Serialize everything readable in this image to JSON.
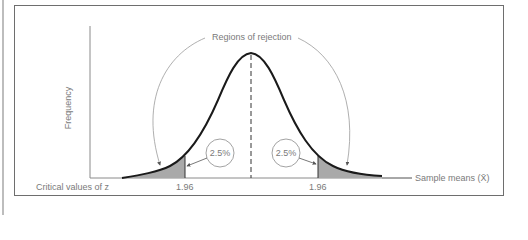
{
  "diagram": {
    "title_annotation": "Regions of rejection",
    "y_axis_label": "Frequency",
    "x_axis_label": "Sample means (X̄)",
    "critical_label": "Critical values of z",
    "left_critical_value": "1.96",
    "right_critical_value": "1.96",
    "left_tail_percent": "2.5%",
    "right_tail_percent": "2.5%",
    "colors": {
      "frame": "#6e6e6e",
      "curve": "#1a1a1a",
      "shading": "#a9a9a9",
      "annotation": "#9a9a9a",
      "text": "#7a7a7a"
    }
  }
}
